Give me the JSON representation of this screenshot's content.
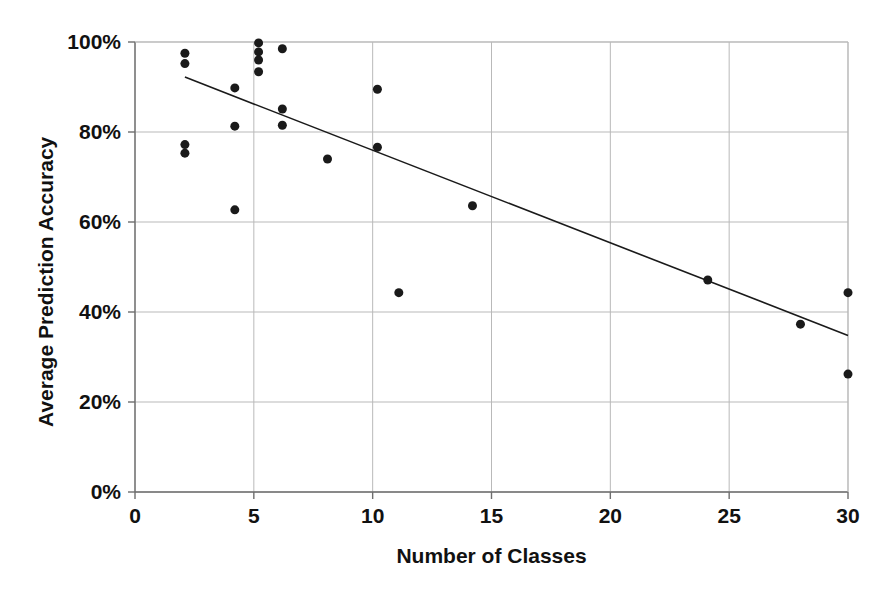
{
  "chart_data": {
    "type": "scatter",
    "title": "",
    "xlabel": "Number of Classes",
    "ylabel": "Average Prediction Accuracy",
    "xlim": [
      0,
      30
    ],
    "ylim": [
      0,
      1.0
    ],
    "xticks": [
      0,
      5,
      10,
      15,
      20,
      25,
      30
    ],
    "xtick_labels": [
      "0",
      "5",
      "10",
      "15",
      "20",
      "25",
      "30"
    ],
    "yticks": [
      0,
      0.2,
      0.4,
      0.6,
      0.8,
      1.0
    ],
    "ytick_labels": [
      "0%",
      "20%",
      "40%",
      "60%",
      "80%",
      "100%"
    ],
    "grid": true,
    "legend": false,
    "marker": {
      "shape": "circle",
      "color": "#1a1a1a",
      "size": 9
    },
    "series": [
      {
        "name": "Datasets",
        "points": [
          {
            "x": 2.1,
            "y": 0.975
          },
          {
            "x": 2.1,
            "y": 0.952
          },
          {
            "x": 2.1,
            "y": 0.772
          },
          {
            "x": 2.1,
            "y": 0.753
          },
          {
            "x": 4.2,
            "y": 0.898
          },
          {
            "x": 4.2,
            "y": 0.813
          },
          {
            "x": 4.2,
            "y": 0.627
          },
          {
            "x": 5.2,
            "y": 0.998
          },
          {
            "x": 5.2,
            "y": 0.978
          },
          {
            "x": 5.2,
            "y": 0.96
          },
          {
            "x": 5.2,
            "y": 0.934
          },
          {
            "x": 6.2,
            "y": 0.985
          },
          {
            "x": 6.2,
            "y": 0.851
          },
          {
            "x": 6.2,
            "y": 0.815
          },
          {
            "x": 8.1,
            "y": 0.74
          },
          {
            "x": 10.2,
            "y": 0.895
          },
          {
            "x": 10.2,
            "y": 0.766
          },
          {
            "x": 11.1,
            "y": 0.443
          },
          {
            "x": 14.2,
            "y": 0.636
          },
          {
            "x": 24.1,
            "y": 0.471
          },
          {
            "x": 28.0,
            "y": 0.373
          },
          {
            "x": 30.0,
            "y": 0.443
          },
          {
            "x": 30.0,
            "y": 0.262
          }
        ]
      }
    ],
    "trendline": {
      "type": "linear",
      "color": "#1a1a1a",
      "x_start": 2.1,
      "y_start": 0.922,
      "x_end": 30.0,
      "y_end": 0.348
    }
  }
}
